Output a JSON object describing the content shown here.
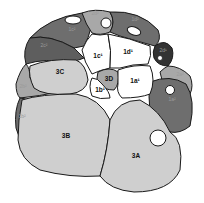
{
  "diagram": {
    "type": "embryo-blastomere-map",
    "colors": {
      "white": "#ffffff",
      "light": "#cfcfcf",
      "mid": "#a8a8a8",
      "dark": "#7a7a7a",
      "darker": "#5e5e5e",
      "darkest": "#333333",
      "outline": "#1a1a1a"
    },
    "labels": {
      "c3A": "3A",
      "c3B": "3B",
      "c3C": "3C",
      "c3D": "3D",
      "c1a": "1a¹",
      "c1b": "1b¹",
      "c1c": "1c¹",
      "c1d": "1d¹",
      "top_left_dark": "2c²",
      "top_left_upper": "1c²",
      "top_center": "2d²",
      "top_right": "1d²",
      "right_dark_small": "2d¹",
      "right_mid": "2a²",
      "right_large_dark": "1a²",
      "left_mid": "2b²",
      "left_lower_dark": "1b²"
    }
  }
}
